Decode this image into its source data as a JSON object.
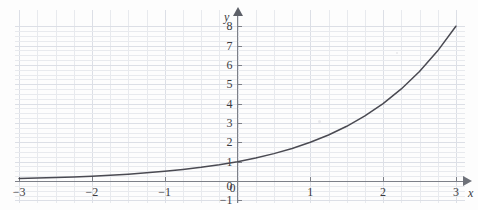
{
  "figure": {
    "kind": "math-graph",
    "axis_color": "#7d8088",
    "curve_color": "#4a4a52",
    "grid_color": "#e8eaee"
  },
  "axes": {
    "x_name": "x",
    "y_name": "y"
  },
  "chart_data": {
    "type": "line",
    "title": "",
    "subtitle": "",
    "xlabel": "x",
    "ylabel": "y",
    "xlim": [
      -3,
      3
    ],
    "ylim": [
      -1,
      8
    ],
    "grid": true,
    "legend": null,
    "minor_grid_divisions": 4,
    "function": "y = 2^x",
    "x_ticks": [
      -3,
      -2,
      -1,
      0,
      1,
      2,
      3
    ],
    "x_tick_labels": [
      "−3",
      "−2",
      "−1",
      "0",
      "1",
      "2",
      "3"
    ],
    "y_ticks": [
      -1,
      0,
      1,
      2,
      3,
      4,
      5,
      6,
      7,
      8
    ],
    "y_tick_labels": [
      "−1",
      "0",
      "1",
      "2",
      "3",
      "4",
      "5",
      "6",
      "7",
      "8"
    ],
    "series": [
      {
        "name": "y = 2^x",
        "x": [
          -3,
          -2.75,
          -2.5,
          -2.25,
          -2,
          -1.75,
          -1.5,
          -1.25,
          -1,
          -0.75,
          -0.5,
          -0.25,
          0,
          0.25,
          0.5,
          0.75,
          1,
          1.25,
          1.5,
          1.75,
          2,
          2.25,
          2.5,
          2.75,
          3
        ],
        "values": [
          0.125,
          0.149,
          0.177,
          0.21,
          0.25,
          0.297,
          0.354,
          0.42,
          0.5,
          0.595,
          0.707,
          0.841,
          1,
          1.189,
          1.414,
          1.682,
          2,
          2.378,
          2.828,
          3.364,
          4,
          4.757,
          5.657,
          6.727,
          8
        ]
      }
    ],
    "annotations": []
  }
}
